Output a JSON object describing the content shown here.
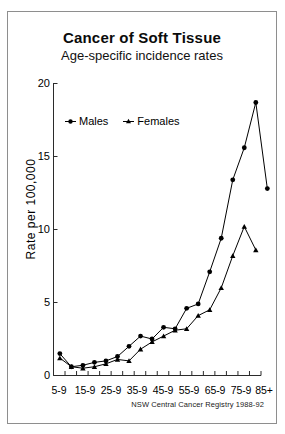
{
  "scan": {
    "top_strip_text": "         "
  },
  "header": {
    "title": "Cancer  of Soft Tissue",
    "subtitle": "Age-specific incidence rates"
  },
  "footer": {
    "source": "NSW Central Cancer Registry 1988-92"
  },
  "legend": {
    "position": "inside-top-left",
    "items": [
      {
        "label": "Males",
        "marker": "circle-marker",
        "color": "#000000"
      },
      {
        "label": "Females",
        "marker": "triangle-marker",
        "color": "#000000"
      }
    ]
  },
  "axes": {
    "y_title": "Rate per 100,000",
    "y_ticks": [
      "0",
      "5",
      "10",
      "15",
      "20"
    ],
    "x_ticks": [
      "5-9",
      "15-9",
      "25-9",
      "35-9",
      "45-9",
      "55-9",
      "65-9",
      "75-9",
      "85+"
    ]
  },
  "chart_data": {
    "type": "line",
    "title": "Cancer  of Soft Tissue",
    "subtitle": "Age-specific incidence rates",
    "xlabel": "",
    "ylabel": "Rate per 100,000",
    "ylim": [
      0,
      20
    ],
    "yticks": [
      0,
      5,
      10,
      15,
      20
    ],
    "grid": false,
    "legend_position": "inside-top-left",
    "annotation": "NSW Central Cancer Registry 1988-92",
    "categories": [
      "0-4",
      "5-9",
      "10-14",
      "15-19",
      "20-24",
      "25-29",
      "30-34",
      "35-39",
      "40-44",
      "45-49",
      "50-54",
      "55-59",
      "60-64",
      "65-69",
      "70-74",
      "75-79",
      "80-84",
      "85+"
    ],
    "xtick_labels": [
      "5-9",
      "15-9",
      "25-9",
      "35-9",
      "45-9",
      "55-9",
      "65-9",
      "75-9",
      "85+"
    ],
    "series": [
      {
        "name": "Males",
        "marker": "circle",
        "color": "#000000",
        "values": [
          1.5,
          0.6,
          0.7,
          0.9,
          1.0,
          1.3,
          2.0,
          2.7,
          2.5,
          3.3,
          3.2,
          4.6,
          4.9,
          7.1,
          9.4,
          13.4,
          15.6,
          18.7
        ]
      },
      {
        "name": "Females",
        "marker": "triangle",
        "color": "#000000",
        "values": [
          1.2,
          0.6,
          0.5,
          0.6,
          0.8,
          1.1,
          1.0,
          1.8,
          2.3,
          2.7,
          3.1,
          3.2,
          4.1,
          4.5,
          6.0,
          8.2,
          10.2,
          8.6
        ]
      }
    ],
    "series_extra_tail": {
      "Males": [
        12.8
      ],
      "Females": []
    },
    "peak": {
      "series": "Males",
      "category": "80-84",
      "value": 18.7
    }
  }
}
